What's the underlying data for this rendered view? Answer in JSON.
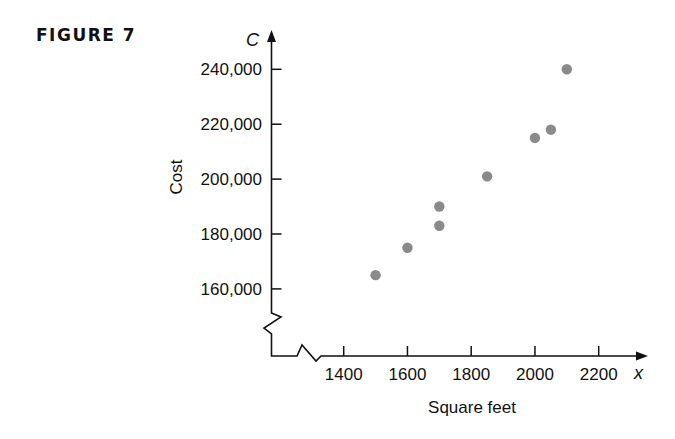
{
  "figure": {
    "label": "FIGURE 7"
  },
  "chart_data": {
    "type": "scatter",
    "title": "",
    "xlabel": "Square feet",
    "ylabel": "Cost",
    "x_axis_variable": "x",
    "y_axis_variable": "C",
    "x_ticks": [
      1400,
      1600,
      1800,
      2000,
      2200
    ],
    "x_tick_labels": [
      "1400",
      "1600",
      "1800",
      "2000",
      "2200"
    ],
    "y_ticks": [
      160000,
      180000,
      200000,
      220000,
      240000
    ],
    "y_tick_labels": [
      "160,000",
      "180,000",
      "200,000",
      "220,000",
      "240,000"
    ],
    "xlim": [
      1200,
      2300
    ],
    "ylim": [
      140000,
      250000
    ],
    "axis_breaks": {
      "x": true,
      "y": true
    },
    "grid": false,
    "legend": null,
    "point_color": "#8a8a8a",
    "points": [
      {
        "x": 1500,
        "y": 165000
      },
      {
        "x": 1600,
        "y": 175000
      },
      {
        "x": 1700,
        "y": 183000
      },
      {
        "x": 1700,
        "y": 190000
      },
      {
        "x": 1850,
        "y": 201000
      },
      {
        "x": 2000,
        "y": 215000
      },
      {
        "x": 2050,
        "y": 218000
      },
      {
        "x": 2100,
        "y": 240000
      }
    ]
  }
}
